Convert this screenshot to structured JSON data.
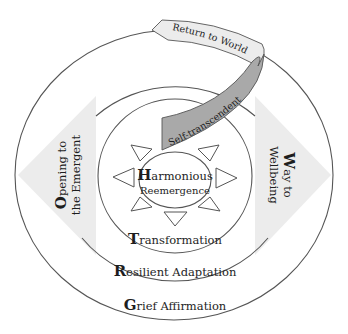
{
  "diagram": {
    "rings": [
      {
        "id": "grief",
        "initial": "G",
        "rest": "rief Affirmation"
      },
      {
        "id": "resilient",
        "initial": "R",
        "rest": "esilient Adaptation"
      },
      {
        "id": "transformation",
        "initial": "T",
        "rest": "ransformation"
      }
    ],
    "core": {
      "initial": "H",
      "rest": "armonious",
      "line2": "Reemergence"
    },
    "side_left": {
      "initial": "O",
      "rest": "pening to",
      "line2": "the Emergent"
    },
    "side_right": {
      "initial": "W",
      "rest": "ay to",
      "line2": "Wellbeing"
    },
    "ribbon": {
      "inner_label": "Self-transcendent",
      "outer_label": "Return to World"
    },
    "colors": {
      "line": "#555555",
      "diamond_fill": "#ececec",
      "ribbon_dark": "#a9a9a9",
      "ribbon_light": "#ececec",
      "text": "#1e1e1e"
    }
  }
}
